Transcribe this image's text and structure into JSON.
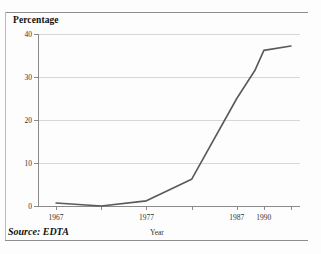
{
  "figure": {
    "title": "Percentage",
    "source": "Source: EDTA"
  },
  "chart_data": {
    "type": "line",
    "title": "Percentage",
    "xlabel": "Year",
    "ylabel": "Percentage",
    "xlim": [
      1965,
      1994
    ],
    "ylim": [
      0,
      40
    ],
    "grid": true,
    "legend": false,
    "y_ticks": [
      0,
      10,
      20,
      30,
      40
    ],
    "y_tick_labels": [
      "0",
      "10",
      "20",
      "30",
      "40"
    ],
    "x_ticks": [
      1967,
      1972,
      1977,
      1982,
      1987,
      1990,
      1993
    ],
    "x_tick_labels": [
      "1967",
      "",
      "1977",
      "",
      "1987",
      "1990",
      ""
    ],
    "x_labeled_ticks": [
      {
        "value": 1967,
        "label": "1967"
      },
      {
        "value": 1977,
        "label": "1977"
      },
      {
        "value": 1987,
        "label": "1987"
      },
      {
        "value": 1990,
        "label": "1990"
      }
    ],
    "series": [
      {
        "name": "Percentage",
        "color": "#555a5e",
        "x": [
          1967,
          1972,
          1977,
          1982,
          1987,
          1989,
          1990,
          1993
        ],
        "values": [
          0.7,
          0.0,
          1.2,
          6.2,
          25.0,
          31.5,
          36.2,
          37.2
        ]
      }
    ],
    "annotations": [
      "Source: EDTA"
    ]
  }
}
